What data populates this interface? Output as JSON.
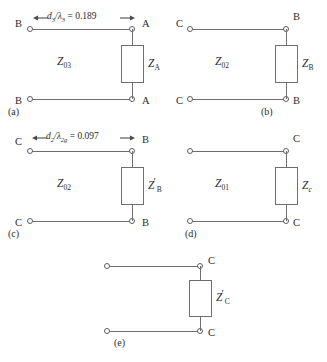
{
  "figure": {
    "caption_labels": {
      "a": "(a)",
      "b": "(b)",
      "c": "(c)",
      "d": "(d)",
      "e": "(e)"
    }
  },
  "circuits": [
    {
      "id": "a",
      "sublabel": "(a)",
      "dimension": {
        "text": "d3/λ3 = 0.189",
        "numerator": "d",
        "numerator_sub": "3",
        "denominator": "λ",
        "denominator_sub": "3",
        "value": "0.189",
        "left_arrow": "←",
        "right_arrow": "→"
      },
      "line_impedance": {
        "symbol": "Z",
        "subscript": "03",
        "prime": false
      },
      "load_impedance": {
        "symbol": "Z",
        "subscript": "A",
        "prime": false
      },
      "terminals": {
        "top_left": "B",
        "top_right": "A",
        "bottom_left": "B",
        "bottom_right": "A"
      }
    },
    {
      "id": "b",
      "sublabel": "(b)",
      "dimension": null,
      "line_impedance": {
        "symbol": "Z",
        "subscript": "02",
        "prime": false
      },
      "load_impedance": {
        "symbol": "Z",
        "subscript": "B",
        "prime": false
      },
      "terminals": {
        "top_left": "C",
        "top_right": "B",
        "bottom_left": "C",
        "bottom_right": "B"
      }
    },
    {
      "id": "c",
      "sublabel": "(c)",
      "dimension": {
        "text": "d2/λ2g = 0.097",
        "numerator": "d",
        "numerator_sub": "2",
        "denominator": "λ",
        "denominator_sub": "2g",
        "value": "0.097",
        "left_arrow": "←",
        "right_arrow": "→"
      },
      "line_impedance": {
        "symbol": "Z",
        "subscript": "02",
        "prime": false
      },
      "load_impedance": {
        "symbol": "Z",
        "subscript": "B",
        "prime": true
      },
      "terminals": {
        "top_left": "C",
        "top_right": "B",
        "bottom_left": "C",
        "bottom_right": "B"
      }
    },
    {
      "id": "d",
      "sublabel": "(d)",
      "dimension": null,
      "line_impedance": {
        "symbol": "Z",
        "subscript": "01",
        "prime": false
      },
      "load_impedance": {
        "symbol": "Z",
        "subscript": "c",
        "prime": false
      },
      "terminals": {
        "top_left": "",
        "top_right": "C",
        "bottom_left": "",
        "bottom_right": "C"
      }
    },
    {
      "id": "e",
      "sublabel": "(e)",
      "dimension": null,
      "line_impedance": null,
      "load_impedance": {
        "symbol": "Z",
        "subscript": "C",
        "prime": true
      },
      "terminals": {
        "top_left": "",
        "top_right": "C",
        "bottom_left": "",
        "bottom_right": "C"
      }
    }
  ],
  "colors": {
    "wire": "#6f6f6f",
    "text": "#2b2b2b",
    "background": "#ffffff"
  }
}
